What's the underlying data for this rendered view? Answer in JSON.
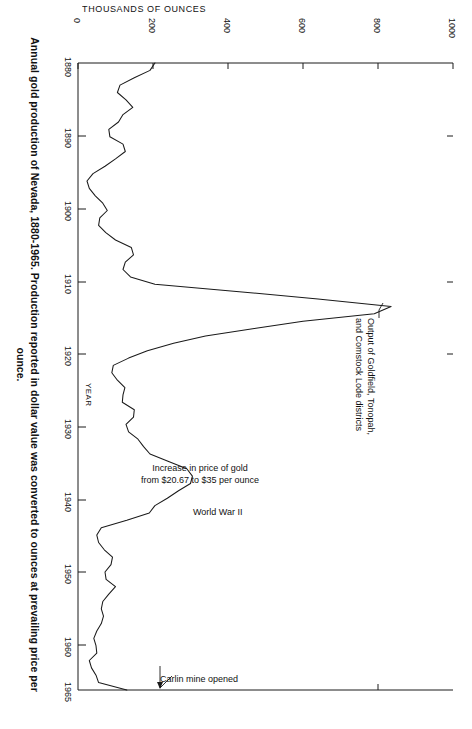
{
  "figure": {
    "caption_line1": "Annual gold production of Nevada, 1880-1965. Production reported in dollar value was converted to ounces at prevailing price per",
    "caption_line2": "ounce.",
    "orientation": "rotated-90-clockwise",
    "line_color": "#1a1a1a",
    "axis_color": "#1a1a1a",
    "background": "#ffffff"
  },
  "chart_data": {
    "type": "line",
    "title": "Annual gold production of Nevada, 1880-1965",
    "orientation": "horizontal-rotated",
    "xlabel": "YEAR",
    "ylabel": "THOUSANDS OF OUNCES",
    "xlim": [
      1880,
      1965
    ],
    "ylim": [
      0,
      1000
    ],
    "grid": false,
    "legend": "none",
    "x_ticks": [
      1880,
      1890,
      1900,
      1910,
      1920,
      1930,
      1940,
      1950,
      1960,
      1965
    ],
    "x_tick_labels": [
      "1880",
      "1890",
      "1900",
      "1910",
      "1920",
      "1930",
      "1940",
      "1950",
      "1960",
      "1965"
    ],
    "y_ticks": [
      0,
      200,
      400,
      600,
      800,
      1000
    ],
    "y_tick_labels": [
      "0",
      "200",
      "400",
      "600",
      "800",
      "1000"
    ],
    "series": [
      {
        "name": "Annual gold production",
        "units": "thousands of ounces",
        "x": [
          1880,
          1881,
          1882,
          1883,
          1884,
          1885,
          1886,
          1887,
          1888,
          1889,
          1890,
          1891,
          1892,
          1893,
          1894,
          1895,
          1896,
          1897,
          1898,
          1899,
          1900,
          1901,
          1902,
          1903,
          1904,
          1905,
          1906,
          1907,
          1908,
          1909,
          1910,
          1911,
          1912,
          1913,
          1914,
          1915,
          1916,
          1917,
          1918,
          1919,
          1920,
          1921,
          1922,
          1923,
          1924,
          1925,
          1926,
          1927,
          1928,
          1929,
          1930,
          1931,
          1932,
          1933,
          1934,
          1935,
          1936,
          1937,
          1938,
          1939,
          1940,
          1941,
          1942,
          1943,
          1944,
          1945,
          1946,
          1947,
          1948,
          1949,
          1950,
          1951,
          1952,
          1953,
          1954,
          1955,
          1956,
          1957,
          1958,
          1959,
          1960,
          1961,
          1962,
          1963,
          1964,
          1965
        ],
        "y": [
          205,
          192,
          150,
          112,
          105,
          128,
          146,
          120,
          108,
          82,
          85,
          120,
          126,
          100,
          72,
          40,
          24,
          30,
          46,
          66,
          78,
          58,
          55,
          74,
          100,
          142,
          148,
          126,
          120,
          140,
          205,
          430,
          640,
          835,
          790,
          600,
          470,
          340,
          255,
          185,
          135,
          94,
          90,
          105,
          125,
          120,
          118,
          150,
          148,
          128,
          135,
          160,
          175,
          192,
          240,
          290,
          305,
          300,
          268,
          238,
          205,
          190,
          130,
          62,
          50,
          55,
          70,
          92,
          88,
          72,
          75,
          100,
          82,
          66,
          62,
          68,
          62,
          50,
          42,
          48,
          50,
          30,
          36,
          48,
          55,
          130
        ],
        "note": "Values estimated from the plotted curve; axis in thousands of ounces"
      }
    ],
    "annotations": [
      {
        "id": "goldfield",
        "text": "Output of Goldfield, Tonopah,\nand Comstock Lode districts",
        "line1": "Output of Goldfield, Tonopah,",
        "line2": "and Comstock Lode districts",
        "points_to_year": 1911,
        "points_to_value": 640
      },
      {
        "id": "gold-price",
        "text": "Increase in price of gold\nfrom $20.67 to $35 per ounce",
        "line1": "Increase in price of gold",
        "line2": "from $20.67 to $35 per ounce",
        "points_to_year": 1934
      },
      {
        "id": "world-war-ii",
        "text": "World War II",
        "line1": "World War II",
        "points_to_year": 1942
      },
      {
        "id": "carlin-mine",
        "text": "Carlin mine opened",
        "line1": "Carlin mine opened",
        "points_to_year": 1965
      }
    ]
  },
  "axes": {
    "value_axis_title": "THOUSANDS  OF  OUNCES",
    "year_axis_title": "YEAR"
  }
}
